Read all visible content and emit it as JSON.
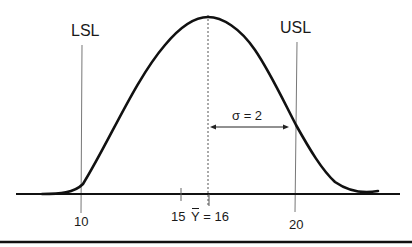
{
  "diagram": {
    "labels": {
      "lsl": "LSL",
      "usl": "USL",
      "sigma": "σ = 2",
      "tick_10": "10",
      "tick_15": "15",
      "mean_symbol": "Y",
      "mean_rest": " = 16",
      "tick_20": "20"
    },
    "values": {
      "lsl": 10,
      "usl": 20,
      "mean": 16,
      "sigma": 2,
      "visible_ticks": [
        10,
        15,
        16,
        20
      ]
    },
    "colors": {
      "curve": "#111111",
      "axis": "#111111",
      "spec_lines": "#777777",
      "mean_line": "#555555",
      "text": "#1a1a1a"
    }
  }
}
